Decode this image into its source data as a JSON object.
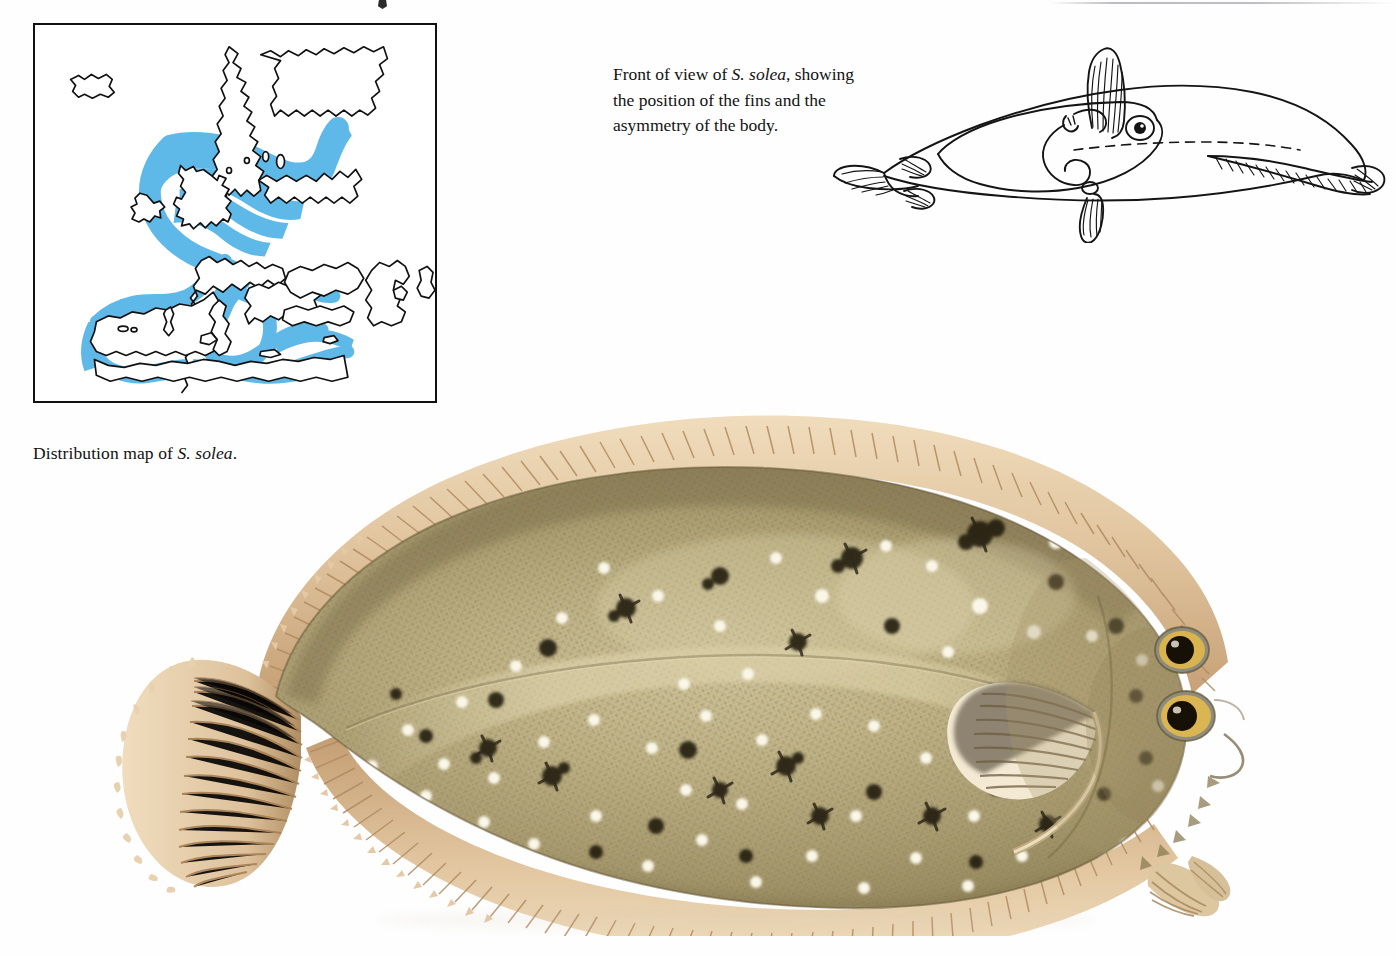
{
  "page": {
    "background_color": "#ffffff",
    "width": 1395,
    "height": 958
  },
  "map_figure": {
    "caption_prefix": "Distribution map of ",
    "caption_species": "S. solea",
    "caption_suffix": ".",
    "border_color": "#111111",
    "range_fill_color": "#5fb9e8",
    "coastline_color": "#111111",
    "land_fill_color": "#ffffff",
    "regions_shown": [
      "Iceland",
      "Scandinavia",
      "British Isles",
      "North Sea",
      "Baltic Sea",
      "Bay of Biscay",
      "Iberia",
      "Mediterranean Sea",
      "Black Sea",
      "Caspian Sea"
    ]
  },
  "front_view_figure": {
    "caption_part1": "Front of view of ",
    "caption_species": "S. solea",
    "caption_part2": ", showing",
    "caption_line2": "the position of the fins and the",
    "caption_line3": "asymmetry of the body.",
    "style": "black ink line drawing",
    "line_color": "#141414",
    "features_shown": [
      "dorsal fin",
      "pelvic fin",
      "pectoral fin",
      "caudal fin",
      "two eyes on one side",
      "mouth",
      "nostril",
      "gill opening"
    ]
  },
  "main_plate": {
    "subject": "S. solea",
    "view": "eyed side, lateral",
    "colors": {
      "body_base": "#b5a57e",
      "body_shadow": "#8d8159",
      "body_highlight": "#cfc49c",
      "fin_ray": "#dcc09a",
      "fin_ray_dark": "#b8946c",
      "fin_membrane": "#e8d4b4",
      "blotch_dark": "#1f1a12",
      "white_spot": "#fdfbf2",
      "eye_iris": "#d8b24c",
      "eye_pupil": "#191206",
      "outline": "#6b5d3c"
    },
    "anatomy": [
      "dorsal fin",
      "anal fin",
      "caudal fin",
      "pectoral fin",
      "pelvic fin",
      "upper eye",
      "lower eye",
      "lateral line",
      "dark star-shaped blotches",
      "white spots",
      "ctenoid scale texture"
    ]
  }
}
